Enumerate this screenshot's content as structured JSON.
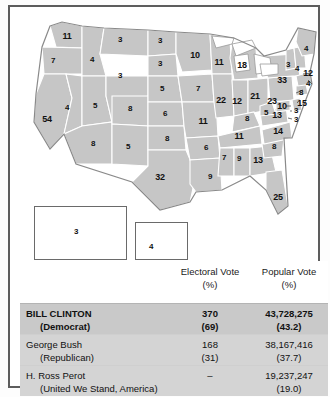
{
  "map": {
    "title": "1992 United States presidential election electoral vote map",
    "colors": {
      "state_fill": "#c6c6c6",
      "state_border": "#ffffff",
      "map_outline": "#8a8a8a",
      "frame": "#5d5d5d",
      "page_background": "#ffffff"
    },
    "states": [
      {
        "name": "Washington",
        "abbr": "WA",
        "votes": "11",
        "x": 47,
        "y": 22
      },
      {
        "name": "Oregon",
        "abbr": "OR",
        "votes": "7",
        "x": 33,
        "y": 47
      },
      {
        "name": "California",
        "abbr": "CA",
        "votes": "54",
        "x": 27,
        "y": 105
      },
      {
        "name": "Nevada",
        "abbr": "NV",
        "votes": "4",
        "x": 47,
        "y": 94
      },
      {
        "name": "Idaho",
        "abbr": "ID",
        "votes": "4",
        "x": 72,
        "y": 46
      },
      {
        "name": "Montana",
        "abbr": "MT",
        "votes": "3",
        "x": 100,
        "y": 26
      },
      {
        "name": "Wyoming",
        "abbr": "WY",
        "votes": "3",
        "x": 100,
        "y": 62
      },
      {
        "name": "Utah",
        "abbr": "UT",
        "votes": "5",
        "x": 75,
        "y": 92
      },
      {
        "name": "Arizona",
        "abbr": "AZ",
        "votes": "8",
        "x": 73,
        "y": 130
      },
      {
        "name": "Colorado",
        "abbr": "CO",
        "votes": "8",
        "x": 110,
        "y": 95
      },
      {
        "name": "New Mexico",
        "abbr": "NM",
        "votes": "5",
        "x": 108,
        "y": 133
      },
      {
        "name": "North Dakota",
        "abbr": "ND",
        "votes": "3",
        "x": 140,
        "y": 27
      },
      {
        "name": "South Dakota",
        "abbr": "SD",
        "votes": "3",
        "x": 140,
        "y": 50
      },
      {
        "name": "Nebraska",
        "abbr": "NE",
        "votes": "5",
        "x": 142,
        "y": 75
      },
      {
        "name": "Kansas",
        "abbr": "KS",
        "votes": "6",
        "x": 145,
        "y": 100
      },
      {
        "name": "Oklahoma",
        "abbr": "OK",
        "votes": "8",
        "x": 147,
        "y": 125
      },
      {
        "name": "Texas",
        "abbr": "TX",
        "votes": "32",
        "x": 140,
        "y": 163
      },
      {
        "name": "Minnesota",
        "abbr": "MN",
        "votes": "10",
        "x": 175,
        "y": 41
      },
      {
        "name": "Iowa",
        "abbr": "IA",
        "votes": "7",
        "x": 178,
        "y": 75
      },
      {
        "name": "Missouri",
        "abbr": "MO",
        "votes": "11",
        "x": 183,
        "y": 107
      },
      {
        "name": "Arkansas",
        "abbr": "AR",
        "votes": "6",
        "x": 186,
        "y": 134
      },
      {
        "name": "Louisiana",
        "abbr": "LA",
        "votes": "9",
        "x": 190,
        "y": 163
      },
      {
        "name": "Wisconsin",
        "abbr": "WI",
        "votes": "11",
        "x": 199,
        "y": 48
      },
      {
        "name": "Illinois",
        "abbr": "IL",
        "votes": "22",
        "x": 201,
        "y": 86
      },
      {
        "name": "Michigan",
        "abbr": "MI",
        "votes": "18",
        "x": 222,
        "y": 51
      },
      {
        "name": "Indiana",
        "abbr": "IN",
        "votes": "12",
        "x": 217,
        "y": 87
      },
      {
        "name": "Ohio",
        "abbr": "OH",
        "votes": "21",
        "x": 235,
        "y": 82
      },
      {
        "name": "Kentucky",
        "abbr": "KY",
        "votes": "8",
        "x": 227,
        "y": 105
      },
      {
        "name": "Tennessee",
        "abbr": "TN",
        "votes": "11",
        "x": 219,
        "y": 122
      },
      {
        "name": "Mississippi",
        "abbr": "MS",
        "votes": "7",
        "x": 204,
        "y": 144
      },
      {
        "name": "Alabama",
        "abbr": "AL",
        "votes": "9",
        "x": 219,
        "y": 145
      },
      {
        "name": "Georgia",
        "abbr": "GA",
        "votes": "13",
        "x": 238,
        "y": 146
      },
      {
        "name": "Florida",
        "abbr": "FL",
        "votes": "25",
        "x": 258,
        "y": 183
      },
      {
        "name": "South Carolina",
        "abbr": "SC",
        "votes": "8",
        "x": 254,
        "y": 133
      },
      {
        "name": "North Carolina",
        "abbr": "NC",
        "votes": "14",
        "x": 258,
        "y": 117
      },
      {
        "name": "Virginia",
        "abbr": "VA",
        "votes": "13",
        "x": 257,
        "y": 101
      },
      {
        "name": "West Virginia",
        "abbr": "WV",
        "votes": "5",
        "x": 246,
        "y": 99
      },
      {
        "name": "Maryland",
        "abbr": "MD",
        "votes": "10",
        "x": 262,
        "y": 92
      },
      {
        "name": "Delaware",
        "abbr": "DE",
        "votes": "3",
        "x": 276,
        "y": 97
      },
      {
        "name": "District of Columbia",
        "abbr": "DC",
        "votes": "3",
        "x": 276,
        "y": 106
      },
      {
        "name": "Pennsylvania",
        "abbr": "PA",
        "votes": "23",
        "x": 252,
        "y": 87
      },
      {
        "name": "New York",
        "abbr": "NY",
        "votes": "33",
        "x": 262,
        "y": 66
      },
      {
        "name": "New Jersey",
        "abbr": "NJ",
        "votes": "15",
        "x": 282,
        "y": 89
      },
      {
        "name": "Connecticut",
        "abbr": "CT",
        "votes": "8",
        "x": 281,
        "y": 79
      },
      {
        "name": "Rhode Island",
        "abbr": "RI",
        "votes": "4",
        "x": 288,
        "y": 70
      },
      {
        "name": "Massachusetts",
        "abbr": "MA",
        "votes": "12",
        "x": 288,
        "y": 59
      },
      {
        "name": "Vermont",
        "abbr": "VT",
        "votes": "3",
        "x": 268,
        "y": 51
      },
      {
        "name": "New Hampshire",
        "abbr": "NH",
        "votes": "4",
        "x": 277,
        "y": 55
      },
      {
        "name": "Maine",
        "abbr": "ME",
        "votes": "4",
        "x": 286,
        "y": 35
      }
    ],
    "insets": [
      {
        "name": "Alaska",
        "abbr": "AK",
        "votes": "3",
        "x": 56,
        "y": 218
      },
      {
        "name": "Hawaii",
        "abbr": "HI",
        "votes": "4",
        "x": 131,
        "y": 233
      }
    ]
  },
  "table": {
    "headers": {
      "electoral": "Electoral Vote",
      "electoral_pct": "(%)",
      "popular": "Popular Vote",
      "popular_pct": "(%)"
    },
    "rows": [
      {
        "candidate": "BILL CLINTON",
        "party": "(Democrat)",
        "electoral": "370",
        "electoral_pct": "(69)",
        "popular": "43,728,275",
        "popular_pct": "(43.2)",
        "highlight": true
      },
      {
        "candidate": "George Bush",
        "party": "(Republican)",
        "electoral": "168",
        "electoral_pct": "(31)",
        "popular": "38,167,416",
        "popular_pct": "(37.7)",
        "highlight": false
      },
      {
        "candidate": "H. Ross Perot",
        "party": "(United We Stand, America)",
        "electoral": "–",
        "electoral_pct": "",
        "popular": "19,237,247",
        "popular_pct": "(19.0)",
        "highlight": false
      }
    ]
  }
}
